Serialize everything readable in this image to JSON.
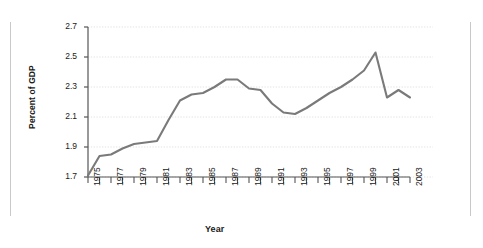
{
  "chart_data": {
    "type": "line",
    "title": "",
    "xlabel": "Year",
    "ylabel": "Percent of GDP",
    "xlim": [
      1975,
      2003
    ],
    "ylim": [
      1.7,
      2.7
    ],
    "ytick_labels": [
      "2.7",
      "2.5",
      "2.3",
      "2.1",
      "1.9",
      "1.7"
    ],
    "yticks": [
      2.7,
      2.5,
      2.3,
      2.1,
      1.9,
      1.7
    ],
    "xtick_labels": [
      "1975",
      "1977",
      "1979",
      "1981",
      "1983",
      "1985",
      "1987",
      "1989",
      "1991",
      "1993",
      "1995",
      "1997",
      "1999",
      "2001",
      "2003"
    ],
    "xticks_major": [
      1975,
      1977,
      1979,
      1981,
      1983,
      1985,
      1987,
      1989,
      1991,
      1993,
      1995,
      1997,
      1999,
      2001,
      2003
    ],
    "xticks_all": [
      1975,
      1976,
      1977,
      1978,
      1979,
      1980,
      1981,
      1982,
      1983,
      1984,
      1985,
      1986,
      1987,
      1988,
      1989,
      1990,
      1991,
      1992,
      1993,
      1994,
      1995,
      1996,
      1997,
      1998,
      1999,
      2000,
      2001,
      2002,
      2003
    ],
    "grid": true,
    "grid_style": "dotted-horizontal",
    "legend": "none",
    "line_color": "#7a7a7a",
    "grid_color": "#e3e3e3",
    "axis_color": "#555555",
    "x": [
      1975,
      1976,
      1977,
      1978,
      1979,
      1980,
      1981,
      1982,
      1983,
      1984,
      1985,
      1986,
      1987,
      1988,
      1989,
      1990,
      1991,
      1992,
      1993,
      1994,
      1995,
      1996,
      1997,
      1998,
      1999,
      2000,
      2001,
      2002,
      2003
    ],
    "values": [
      1.71,
      1.84,
      1.85,
      1.89,
      1.92,
      1.93,
      1.94,
      2.08,
      2.21,
      2.25,
      2.26,
      2.3,
      2.35,
      2.35,
      2.29,
      2.28,
      2.19,
      2.13,
      2.12,
      2.16,
      2.21,
      2.26,
      2.3,
      2.35,
      2.41,
      2.53,
      2.23,
      2.28,
      2.23
    ],
    "series": [
      {
        "name": "Percent of GDP",
        "values": [
          1.71,
          1.84,
          1.85,
          1.89,
          1.92,
          1.93,
          1.94,
          2.08,
          2.21,
          2.25,
          2.26,
          2.3,
          2.35,
          2.35,
          2.29,
          2.28,
          2.19,
          2.13,
          2.12,
          2.16,
          2.21,
          2.26,
          2.3,
          2.35,
          2.41,
          2.53,
          2.23,
          2.28,
          2.23
        ]
      }
    ]
  }
}
